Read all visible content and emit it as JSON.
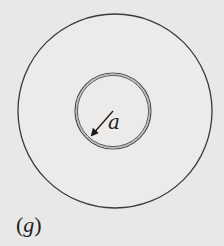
{
  "figure": {
    "caption_open": "(",
    "caption_letter": "g",
    "caption_close": ")",
    "radius_label": "a",
    "outer_circle": {
      "cx": 115,
      "cy": 111,
      "r": 97,
      "stroke": "#3a3a3a"
    },
    "inner_circle": {
      "cx": 113,
      "cy": 111,
      "r": 37,
      "stroke": "#4a4a4a",
      "inner_stroke": "#a8a8a8"
    },
    "radius_arrow": {
      "from": [
        113,
        111
      ],
      "to": [
        92,
        135
      ]
    },
    "colors": {
      "background": "#e8e8e6",
      "fill": "#ececea",
      "ink": "#222222"
    }
  }
}
